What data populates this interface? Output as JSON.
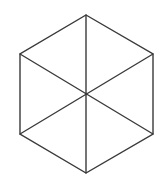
{
  "diagram": {
    "title": "",
    "shape": "regular hexagon with three main diagonals",
    "stroke_color": "#3a3a3a",
    "background_color": "#ffffff",
    "vertices": {
      "top": [
        86,
        15
      ],
      "upper_right": [
        153,
        54
      ],
      "lower_right": [
        153,
        134
      ],
      "bottom": [
        86,
        173
      ],
      "lower_left": [
        20,
        134
      ],
      "upper_left": [
        20,
        54
      ],
      "center": [
        86,
        94
      ]
    },
    "outline_order": [
      "top",
      "upper_right",
      "lower_right",
      "bottom",
      "lower_left",
      "upper_left"
    ],
    "diagonals": [
      [
        "top",
        "bottom"
      ],
      [
        "upper_left",
        "lower_right"
      ],
      [
        "upper_right",
        "lower_left"
      ]
    ]
  }
}
